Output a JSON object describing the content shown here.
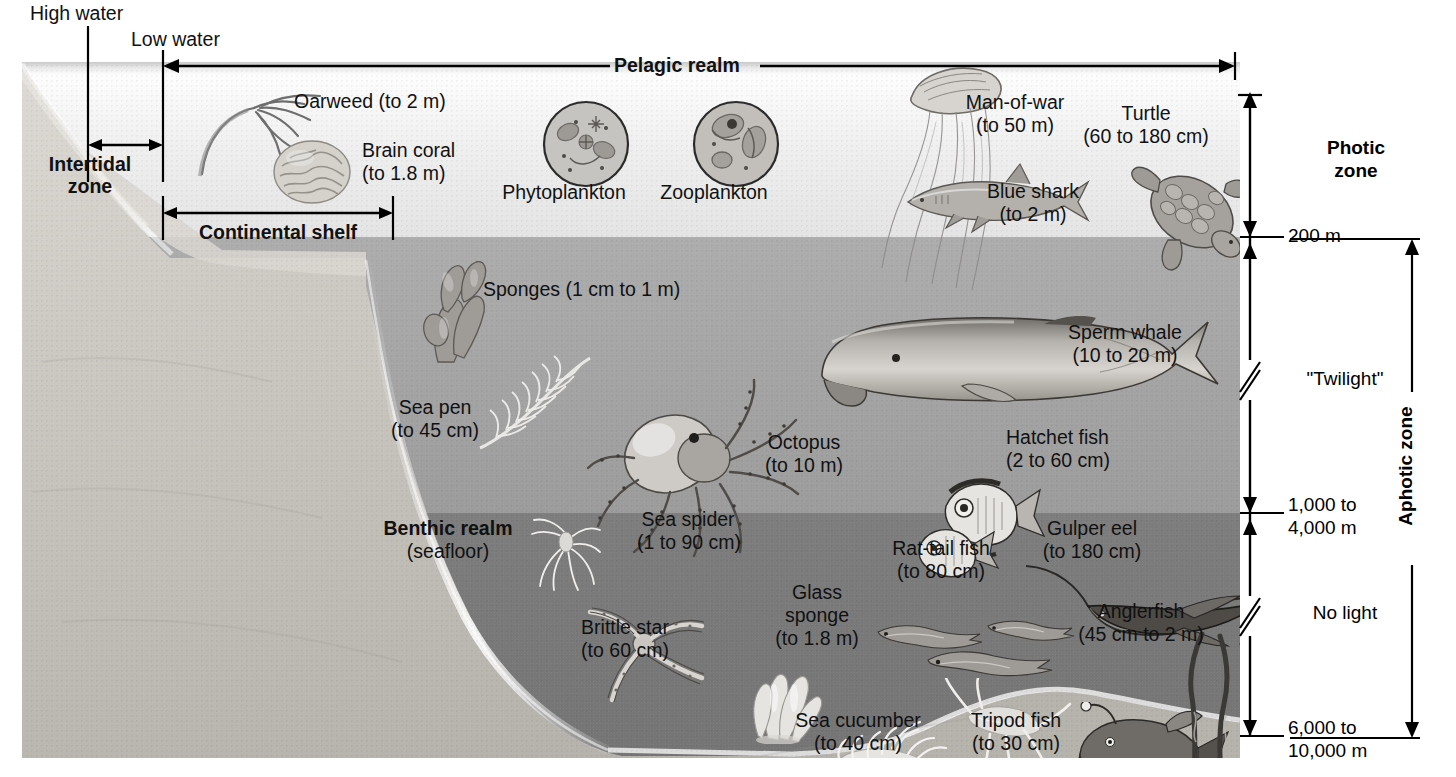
{
  "diagram": {
    "type": "ocean-zonation-cross-section"
  },
  "surface_markers": {
    "high_water": "High water",
    "low_water": "Low water"
  },
  "realms": {
    "pelagic": "Pelagic realm",
    "benthic_name": "Benthic realm",
    "benthic_sub": "(seafloor)"
  },
  "shore_zones": {
    "intertidal_line1": "Intertidal",
    "intertidal_line2": "zone",
    "continental_shelf": "Continental shelf"
  },
  "depth_scale": {
    "photic_line1": "Photic",
    "photic_line2": "zone",
    "twilight": "\"Twilight\"",
    "no_light": "No light",
    "aphotic": "Aphotic zone",
    "mark_200": "200 m",
    "mark_1000_line1": "1,000 to",
    "mark_1000_line2": "4,000 m",
    "mark_6000_line1": "6,000 to",
    "mark_6000_line2": "10,000 m"
  },
  "organisms": [
    {
      "id": "oarweed",
      "name": "Oarweed",
      "size": "(to 2 m)",
      "zone": "photic"
    },
    {
      "id": "brain-coral",
      "name": "Brain coral",
      "size": "(to 1.8 m)",
      "zone": "photic"
    },
    {
      "id": "phytoplankton",
      "name": "Phytoplankton",
      "size": "",
      "zone": "photic"
    },
    {
      "id": "zooplankton",
      "name": "Zooplankton",
      "size": "",
      "zone": "photic"
    },
    {
      "id": "man-of-war",
      "name": "Man-of-war",
      "size": "(to 50 m)",
      "zone": "photic"
    },
    {
      "id": "blue-shark",
      "name": "Blue shark",
      "size": "(to 2 m)",
      "zone": "photic"
    },
    {
      "id": "turtle",
      "name": "Turtle",
      "size": "(60 to 180 cm)",
      "zone": "photic"
    },
    {
      "id": "sponges",
      "name": "Sponges",
      "size": "(1 cm to 1 m)",
      "zone": "twilight"
    },
    {
      "id": "sea-pen",
      "name": "Sea pen",
      "size": "(to 45 cm)",
      "zone": "twilight"
    },
    {
      "id": "octopus",
      "name": "Octopus",
      "size": "(to 10 m)",
      "zone": "twilight"
    },
    {
      "id": "sperm-whale",
      "name": "Sperm whale",
      "size": "(10 to 20 m)",
      "zone": "twilight"
    },
    {
      "id": "hatchet-fish",
      "name": "Hatchet fish",
      "size": "(2 to 60 cm)",
      "zone": "twilight"
    },
    {
      "id": "sea-spider",
      "name": "Sea spider",
      "size": "(1 to 90 cm)",
      "zone": "no-light"
    },
    {
      "id": "brittle-star",
      "name": "Brittle star",
      "size": "(to 60 cm)",
      "zone": "no-light"
    },
    {
      "id": "glass-sponge",
      "name": "Glass sponge",
      "size": "(to 1.8 m)",
      "zone": "no-light"
    },
    {
      "id": "rat-tail-fish",
      "name": "Rat-tail fish",
      "size": "(to 80 cm)",
      "zone": "no-light"
    },
    {
      "id": "gulper-eel",
      "name": "Gulper eel",
      "size": "(to 180 cm)",
      "zone": "no-light"
    },
    {
      "id": "anglerfish",
      "name": "Anglerfish",
      "size": "(45 cm to 2 m)",
      "zone": "no-light"
    },
    {
      "id": "sea-cucumber",
      "name": "Sea cucumber",
      "size": "(to 40 cm)",
      "zone": "no-light"
    },
    {
      "id": "tripod-fish",
      "name": "Tripod fish",
      "size": "(to 30 cm)",
      "zone": "no-light"
    }
  ],
  "labels": {
    "oarweed": "Oarweed (to 2 m)",
    "brain_coral_1": "Brain coral",
    "brain_coral_2": "(to 1.8 m)",
    "phytoplankton": "Phytoplankton",
    "zooplankton": "Zooplankton",
    "manofwar_1": "Man-of-war",
    "manofwar_2": "(to 50 m)",
    "blueshark_1": "Blue shark",
    "blueshark_2": "(to 2 m)",
    "turtle_1": "Turtle",
    "turtle_2": "(60 to 180 cm)",
    "sponges": "Sponges (1 cm to 1 m)",
    "seapen_1": "Sea pen",
    "seapen_2": "(to 45 cm)",
    "octopus_1": "Octopus",
    "octopus_2": "(to 10 m)",
    "spermwhale_1": "Sperm whale",
    "spermwhale_2": "(10 to 20 m)",
    "hatchet_1": "Hatchet fish",
    "hatchet_2": "(2 to 60 cm)",
    "seaspider_1": "Sea spider",
    "seaspider_2": "(1 to 90 cm)",
    "brittlestar_1": "Brittle star",
    "brittlestar_2": "(to 60 cm)",
    "glasssponge_1": "Glass",
    "glasssponge_2": "sponge",
    "glasssponge_3": "(to 1.8 m)",
    "rattail_1": "Rat-tail fish",
    "rattail_2": "(to 80 cm)",
    "gulper_1": "Gulper eel",
    "gulper_2": "(to 180 cm)",
    "angler_1": "Anglerfish",
    "angler_2": "(45 cm to 2 m)",
    "cucumber_1": "Sea cucumber",
    "cucumber_2": "(to 40 cm)",
    "tripod_1": "Tripod fish",
    "tripod_2": "(to 30 cm)"
  },
  "colors": {
    "ink": "#000000",
    "photic_water": "#efefef",
    "twilight_water": "#a3a3a3",
    "nolight_water": "#787878",
    "seafloor": "#c4c2bd"
  }
}
